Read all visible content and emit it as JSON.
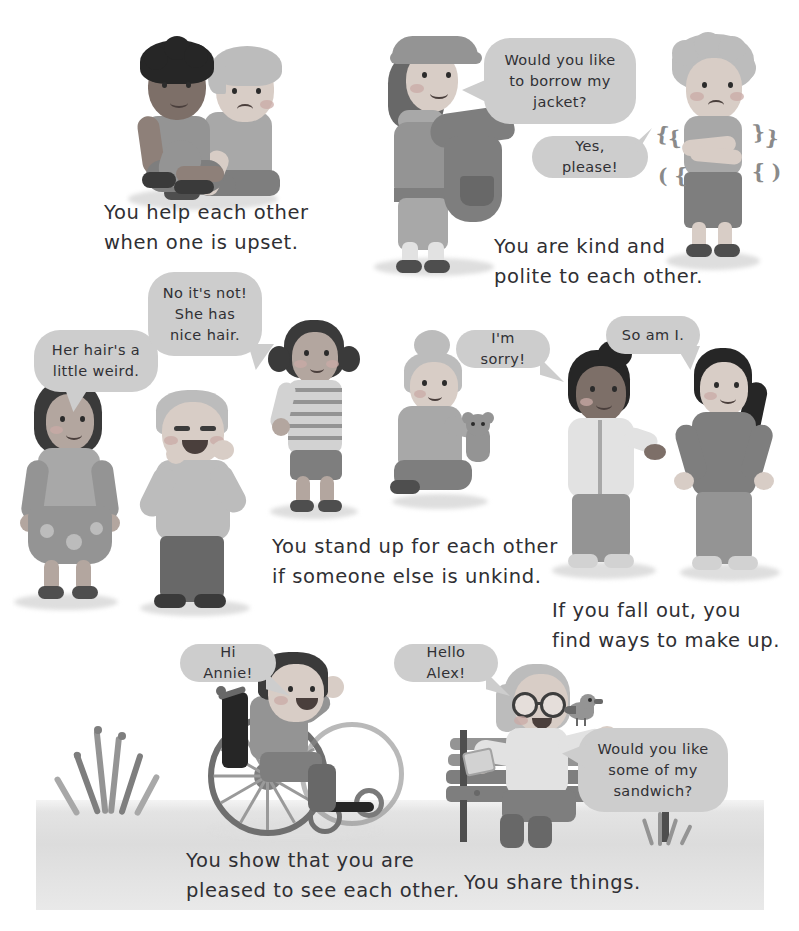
{
  "page": {
    "background_color": "#ffffff",
    "width": 799,
    "height": 931
  },
  "palette": {
    "bubble_fill": "#cdcdcd",
    "text_color": "#2f2f33",
    "ground": "#e3e3e3",
    "shadow": "#dedede"
  },
  "scenes": [
    {
      "id": "scene-help",
      "caption": "You help each other\nwhen one is upset.",
      "bubbles": [],
      "characters": [
        "comforting-child",
        "upset-child"
      ]
    },
    {
      "id": "scene-kind-polite",
      "caption": "You are kind and\npolite to each other.",
      "bubbles": [
        {
          "id": "bubble-borrow-jacket",
          "text": "Would you like\nto borrow my\njacket?"
        },
        {
          "id": "bubble-yes-please",
          "text": "Yes, please!"
        }
      ],
      "characters": [
        "girl-offering-jacket",
        "shivering-boy"
      ]
    },
    {
      "id": "scene-stand-up",
      "caption": "You stand up for each other\nif someone else is unkind.",
      "bubbles": [
        {
          "id": "bubble-her-hair",
          "text": "Her hair's a\nlittle weird."
        },
        {
          "id": "bubble-no-its-not",
          "text": "No it's not!\nShe has\nnice hair."
        }
      ],
      "characters": [
        "teasing-girl",
        "laughing-boy",
        "defending-girl",
        "girl-with-bun-and-doll"
      ]
    },
    {
      "id": "scene-make-up",
      "caption": "If you fall out, you\nfind ways to make up.",
      "bubbles": [
        {
          "id": "bubble-im-sorry",
          "text": "I'm sorry!"
        },
        {
          "id": "bubble-so-am-i",
          "text": "So am I."
        }
      ],
      "characters": [
        "apologising-girl",
        "accepting-girl"
      ]
    },
    {
      "id": "scene-greeting",
      "caption": "You show that you are\npleased to see each other.",
      "bubbles": [
        {
          "id": "bubble-hi-annie",
          "text": "Hi Annie!"
        }
      ],
      "characters": [
        "boy-in-wheelchair"
      ]
    },
    {
      "id": "scene-sharing",
      "caption": "You share things.",
      "bubbles": [
        {
          "id": "bubble-hello-alex",
          "text": "Hello Alex!"
        },
        {
          "id": "bubble-sandwich",
          "text": "Would you like\nsome of my\nsandwich?"
        }
      ],
      "characters": [
        "girl-on-bench",
        "bird"
      ]
    }
  ],
  "effects": {
    "shiver_marks_left": [
      "{",
      "{",
      "( {"
    ],
    "shiver_marks_right": [
      "}",
      "}",
      "}"
    ]
  }
}
